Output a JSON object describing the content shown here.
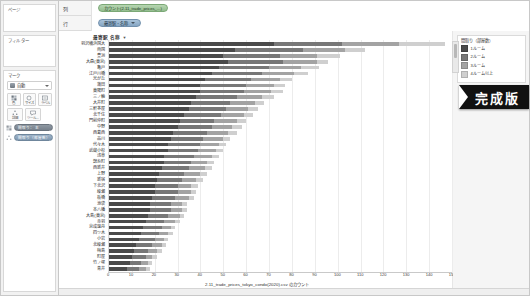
{
  "app": {
    "name": "Tableau Desktop"
  },
  "left_panel": {
    "pages": {
      "title": "ページ"
    },
    "filters": {
      "title": "フィルター"
    },
    "marks": {
      "title": "マーク",
      "mark_type": "自動",
      "buttons": [
        {
          "name": "color",
          "label": "色",
          "icon": "color-icon"
        },
        {
          "name": "size",
          "label": "サイズ",
          "icon": "size-icon"
        },
        {
          "name": "label",
          "label": "ラベル",
          "icon": "label-icon"
        },
        {
          "name": "detail",
          "label": "詳細",
          "icon": "detail-icon"
        },
        {
          "name": "tooltip",
          "label": "ツール...",
          "icon": "tooltip-icon"
        }
      ],
      "pills": [
        {
          "icon": "color-pill-icon",
          "label": "間取り  ：  主"
        },
        {
          "icon": "detail-pill-icon",
          "label": "間取り（部屋数）"
        }
      ]
    }
  },
  "shelves": {
    "columns": {
      "label": "列",
      "pill": "カウント(2.11_trade_prices_...)",
      "pill_color": "green"
    },
    "rows": {
      "label": "行",
      "pill": "最寄駅・名称",
      "pill_color": "blue"
    }
  },
  "viz": {
    "header": "最寄駅 名称",
    "sort_indicator": "▼",
    "x_axis": {
      "title": "2.11_trade_prices_tokyo_condo(2020).csv のカウント",
      "ticks": [
        "0",
        "10",
        "20",
        "30",
        "40",
        "50",
        "60",
        "70",
        "80",
        "90",
        "100",
        "110",
        "120",
        "130",
        "140",
        "150"
      ],
      "min": 0,
      "max": 150
    }
  },
  "legend": {
    "title": "間取り（部屋数）",
    "items": [
      {
        "label": "1ルーム",
        "color": "#4a4a4a"
      },
      {
        "label": "2ルーム",
        "color": "#777777"
      },
      {
        "label": "3ルーム",
        "color": "#a3a3a3"
      },
      {
        "label": "4ルーム以上",
        "color": "#cfcfcf"
      }
    ]
  },
  "badge": {
    "text": "完成版"
  },
  "chart_data": {
    "type": "bar",
    "orientation": "horizontal",
    "stacked": true,
    "title": "最寄駅 名称",
    "xlabel": "2.11_trade_prices_tokyo_condo(2020).csv のカウント",
    "ylabel": "最寄駅 名称",
    "xlim": [
      0,
      150
    ],
    "grid": true,
    "legend_position": "right",
    "categories": [
      "羽沢横浜国大",
      "両国",
      "豊洲",
      "大森(東京)",
      "亀戸",
      "江戸川橋",
      "光が丘",
      "蒲田",
      "東陽町",
      "三ノ輪",
      "大井町",
      "三軒茶屋",
      "北千住",
      "門前仲町",
      "中野",
      "西葛西",
      "品川",
      "代々木",
      "武蔵小杉",
      "浅草",
      "錦糸町",
      "西新井",
      "上野",
      "新宿",
      "下北沢",
      "綾瀬",
      "板橋",
      "池袋",
      "本八幡",
      "大島(東京)",
      "赤羽",
      "京成曳舟",
      "四ツ木",
      "小岩",
      "北綾瀬",
      "梅島",
      "町屋",
      "竹ノ塚",
      "青井"
    ],
    "series": [
      {
        "name": "1ルーム",
        "color": "#4a4a4a",
        "values": [
          72,
          55,
          50,
          52,
          48,
          45,
          42,
          40,
          40,
          38,
          36,
          35,
          33,
          31,
          30,
          28,
          27,
          26,
          26,
          24,
          24,
          23,
          22,
          21,
          20,
          20,
          19,
          18,
          18,
          17,
          16,
          15,
          14,
          13,
          12,
          11,
          10,
          9,
          8
        ]
      },
      {
        "name": "2ルーム",
        "color": "#777777",
        "values": [
          30,
          30,
          25,
          24,
          22,
          22,
          20,
          20,
          19,
          18,
          17,
          16,
          16,
          15,
          15,
          15,
          14,
          14,
          13,
          13,
          12,
          12,
          11,
          11,
          10,
          10,
          10,
          9,
          9,
          9,
          8,
          8,
          8,
          7,
          7,
          6,
          6,
          5,
          5
        ]
      },
      {
        "name": "3ルーム",
        "color": "#a3a3a3",
        "values": [
          25,
          18,
          16,
          15,
          14,
          14,
          13,
          12,
          12,
          11,
          11,
          10,
          10,
          10,
          9,
          9,
          9,
          8,
          8,
          8,
          7,
          7,
          7,
          6,
          6,
          6,
          6,
          5,
          5,
          5,
          5,
          4,
          4,
          4,
          4,
          4,
          3,
          3,
          3
        ]
      },
      {
        "name": "4ルーム以上",
        "color": "#cfcfcf",
        "values": [
          20,
          9,
          10,
          5,
          8,
          6,
          5,
          5,
          5,
          5,
          4,
          4,
          4,
          4,
          4,
          4,
          3,
          3,
          3,
          3,
          3,
          3,
          3,
          3,
          3,
          2,
          2,
          2,
          2,
          2,
          2,
          2,
          2,
          2,
          2,
          2,
          2,
          2,
          2
        ]
      }
    ]
  }
}
